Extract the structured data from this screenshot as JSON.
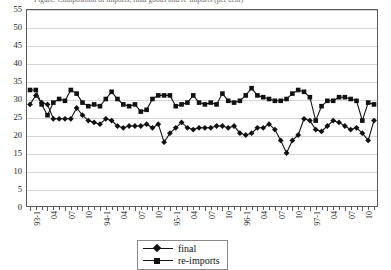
{
  "chart_data": {
    "type": "line",
    "title": "Figure: Composition of imports, final goods and re-imports (per cent)",
    "xlabel": "",
    "ylabel": "",
    "ylim": [
      0,
      55
    ],
    "ytick_step": 5,
    "yticks": [
      0,
      5,
      10,
      15,
      20,
      25,
      30,
      35,
      40,
      45,
      50,
      55
    ],
    "grid": true,
    "legend_position": "bottom-center",
    "x_tick_labels": [
      "93-1",
      "04",
      "07",
      "10",
      "94-1",
      "04",
      "07",
      "10",
      "95-1",
      "04",
      "07",
      "10",
      "96-1",
      "04",
      "07",
      "10",
      "97-1",
      "04",
      "07",
      "10"
    ],
    "x_label_interval_months": 3,
    "n_points": 60,
    "series": [
      {
        "name": "final",
        "marker": "diamond",
        "color": "#111111",
        "values": [
          28.5,
          31.0,
          29.0,
          28.5,
          24.5,
          24.5,
          24.5,
          24.5,
          27.5,
          25.5,
          24.0,
          23.5,
          23.0,
          24.5,
          24.0,
          22.5,
          22.0,
          22.5,
          22.5,
          22.5,
          23.0,
          22.0,
          23.0,
          18.0,
          20.5,
          22.0,
          23.5,
          22.0,
          21.5,
          22.0,
          22.0,
          22.0,
          22.5,
          22.5,
          22.0,
          22.5,
          20.5,
          20.0,
          20.5,
          22.0,
          22.0,
          23.0,
          21.5,
          18.5,
          15.0,
          18.5,
          20.0,
          24.5,
          24.0,
          21.5,
          21.0,
          22.5,
          24.0,
          23.5,
          22.5,
          21.5,
          22.0,
          20.5,
          18.5,
          24.0
        ]
      },
      {
        "name": "re-imports",
        "marker": "square",
        "color": "#111111",
        "values": [
          32.5,
          32.5,
          28.5,
          25.5,
          29.0,
          30.0,
          29.5,
          32.5,
          31.5,
          29.0,
          28.0,
          28.5,
          28.0,
          30.0,
          32.0,
          30.0,
          28.5,
          28.0,
          28.5,
          26.5,
          27.0,
          30.0,
          31.0,
          31.0,
          31.0,
          28.0,
          28.5,
          29.0,
          31.0,
          29.0,
          28.5,
          29.0,
          28.5,
          31.5,
          29.5,
          29.0,
          29.5,
          31.0,
          33.0,
          31.0,
          30.5,
          30.0,
          29.5,
          29.5,
          30.0,
          31.5,
          32.5,
          32.0,
          30.5,
          24.0,
          28.0,
          29.5,
          29.5,
          30.5,
          30.5,
          30.0,
          29.5,
          24.0,
          29.0,
          28.5
        ]
      }
    ]
  },
  "legend": {
    "items": [
      {
        "label": "final"
      },
      {
        "label": "re-imports"
      }
    ]
  }
}
